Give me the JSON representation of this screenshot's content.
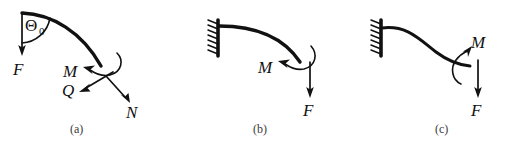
{
  "figure": {
    "background_color": "#ffffff",
    "ink_color": "#111111",
    "caption_color": "#3a3a3a"
  },
  "panels": [
    {
      "id": "a",
      "caption": "(a)",
      "description": "curved beam segment with applied force and internal stress resultants",
      "labels": {
        "angle": "Θ",
        "angle_subscript": "0",
        "force": "F",
        "moment": "M",
        "shear": "Q",
        "normal": "N"
      }
    },
    {
      "id": "b",
      "caption": "(b)",
      "description": "cantilever beam fixed at left wall, deflecting downward with end moment and end force",
      "labels": {
        "moment": "M",
        "force": "F"
      }
    },
    {
      "id": "c",
      "caption": "(c)",
      "description": "cantilever beam fixed at left wall with S-shaped deflection, reversed end moment and end force",
      "labels": {
        "moment": "M",
        "force": "F"
      }
    }
  ]
}
